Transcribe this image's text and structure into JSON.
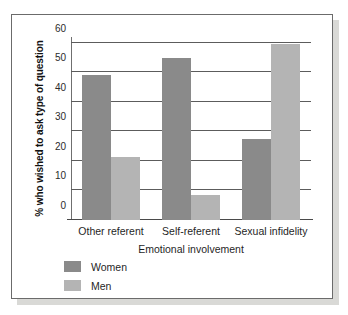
{
  "chart_data": {
    "type": "bar",
    "title": "",
    "subtitle": "",
    "xlabel": "Emotional involvement",
    "ylabel": "% who wished to ask type of question",
    "categories": [
      "Other referent",
      "Self-referent",
      "Sexual infidelity"
    ],
    "series": [
      {
        "name": "Women",
        "values": [
          49,
          55,
          27.5
        ],
        "color": "#8a8a8a"
      },
      {
        "name": "Men",
        "values": [
          21.5,
          8.5,
          59.5
        ],
        "color": "#b4b4b4"
      }
    ],
    "ylim": [
      0,
      62
    ],
    "yticks": [
      0,
      10,
      20,
      30,
      40,
      50,
      60
    ],
    "ytick_labels": [
      "0",
      "10",
      "20",
      "30",
      "40",
      "50",
      "60"
    ],
    "grid": true,
    "grid_axis": "y",
    "legend_position": "bottom-left",
    "legend_entries": [
      "Women",
      "Men"
    ],
    "annotations": []
  },
  "figure": {
    "frame_color": "#6b6b6b",
    "background": "#ffffff",
    "shadow_color": "#d9d9d6"
  }
}
